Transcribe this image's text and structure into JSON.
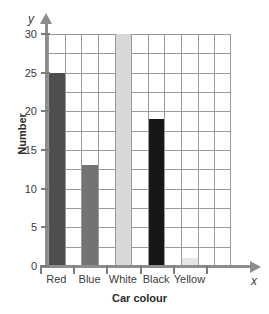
{
  "chart_data": {
    "type": "bar",
    "title": "",
    "categories": [
      "Red",
      "Blue",
      "White",
      "Black",
      "Yellow"
    ],
    "values": [
      25,
      13,
      30,
      19,
      1
    ],
    "xlabel": "Car colour",
    "ylabel": "Number",
    "ylim": [
      0,
      30
    ],
    "xlim_symbol": "x",
    "ylim_symbol": "y",
    "y_ticks": [
      0,
      5,
      10,
      15,
      20,
      25,
      30
    ],
    "y_tick_labels": [
      "0",
      "5",
      "10",
      "15",
      "20",
      "25",
      "30"
    ],
    "grid": true,
    "grid_minor_step": 2.5,
    "legend": null,
    "bar_colors": [
      "#4e4e4e",
      "#737373",
      "#d8d8d8",
      "#171717",
      "#e6e6e6"
    ],
    "axis_color": "#8d8d8d",
    "grid_color": "#9a9a9a",
    "background": "#ffffff"
  },
  "axes": {
    "y_symbol": "y",
    "x_symbol": "x",
    "y_title": "Number",
    "x_title": "Car colour"
  }
}
